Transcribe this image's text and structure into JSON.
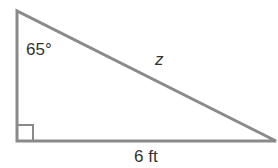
{
  "diagram": {
    "type": "right-triangle",
    "angle_label": "65°",
    "hypotenuse_label": "z",
    "base_label": "6 ft",
    "right_angle_marker": true,
    "stroke_color": "#8a8a8a",
    "text_color": "#333333"
  }
}
